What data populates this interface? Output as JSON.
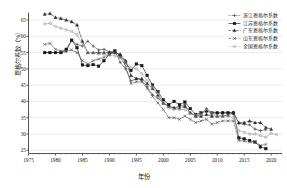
{
  "chart_data": {
    "type": "line",
    "title": "",
    "xlabel": "年份",
    "ylabel": "恩格尔系数（%）",
    "xlim": [
      1975,
      2022
    ],
    "ylim": [
      24,
      67
    ],
    "xticks": [
      1975,
      1980,
      1985,
      1990,
      1995,
      2000,
      2005,
      2010,
      2015,
      2020
    ],
    "yticks": [
      25,
      30,
      35,
      40,
      45,
      50,
      55,
      60,
      65
    ],
    "grid": true,
    "grid_axis": "y",
    "legend_position": "top-right",
    "series": [
      {
        "name": "浙江恩格尔系数",
        "marker": "plus",
        "color": "#3a3a3a",
        "linestyle": "dotted",
        "x": [
          1978,
          1979,
          1980,
          1981,
          1982,
          1983,
          1984,
          1985,
          1986,
          1987,
          1988,
          1989,
          1990,
          1991,
          1992,
          1993,
          1994,
          1995,
          1996,
          1997,
          1998,
          1999,
          2000,
          2001,
          2002,
          2003,
          2004,
          2005,
          2006,
          2007,
          2008,
          2009,
          2010,
          2011,
          2012,
          2013,
          2014,
          2015,
          2016,
          2017,
          2018,
          2019
        ],
        "y": [
          55.0,
          55.0,
          55.0,
          55.0,
          55.3,
          58.8,
          57.5,
          57.0,
          58.5,
          57.0,
          55.8,
          56.0,
          55.2,
          55.5,
          52.0,
          50.0,
          46.3,
          47.0,
          46.5,
          44.5,
          42.0,
          41.0,
          39.5,
          38.5,
          38.0,
          38.5,
          39.0,
          36.5,
          35.5,
          36.0,
          37.8,
          36.5,
          36.4,
          36.5,
          36.5,
          36.5,
          33.2,
          33.0,
          32.8,
          31.5,
          31.0,
          31.3
        ]
      },
      {
        "name": "江苏恩格尔系数",
        "marker": "square",
        "color": "#141414",
        "linestyle": "solid",
        "x": [
          1978,
          1979,
          1980,
          1981,
          1982,
          1983,
          1984,
          1985,
          1986,
          1987,
          1988,
          1989,
          1990,
          1991,
          1992,
          1993,
          1994,
          1995,
          1996,
          1997,
          1998,
          1999,
          2000,
          2001,
          2002,
          2003,
          2004,
          2005,
          2006,
          2007,
          2008,
          2009,
          2010,
          2011,
          2012,
          2013,
          2014,
          2015,
          2016,
          2017,
          2018,
          2019
        ],
        "y": [
          55.0,
          55.0,
          55.0,
          55.0,
          56.0,
          58.8,
          56.5,
          51.2,
          51.0,
          51.3,
          50.8,
          52.5,
          54.5,
          55.5,
          54.0,
          52.0,
          49.5,
          51.5,
          51.0,
          48.0,
          45.0,
          43.0,
          40.5,
          39.0,
          40.0,
          39.0,
          39.8,
          37.8,
          36.0,
          36.5,
          37.0,
          36.5,
          36.5,
          36.5,
          36.5,
          36.5,
          28.8,
          28.5,
          28.0,
          27.5,
          26.0,
          25.5
        ]
      },
      {
        "name": "广东恩格尔系数",
        "marker": "triangle",
        "color": "#2b2b2b",
        "linestyle": "dashed",
        "x": [
          1978,
          1979,
          1980,
          1981,
          1982,
          1983,
          1984,
          1985,
          1986,
          1987,
          1988,
          1989,
          1990,
          1991,
          1992,
          1993,
          1994,
          1995,
          1996,
          1997,
          1998,
          1999,
          2000,
          2001,
          2002,
          2003,
          2004,
          2005,
          2006,
          2007,
          2008,
          2009,
          2010,
          2011,
          2012,
          2013,
          2014,
          2015,
          2016,
          2017,
          2018,
          2019,
          2020
        ],
        "y": [
          66.8,
          67.0,
          65.8,
          65.5,
          65.0,
          64.5,
          63.5,
          58.5,
          55.0,
          55.0,
          55.0,
          55.0,
          55.0,
          55.0,
          54.5,
          52.5,
          48.0,
          47.0,
          47.0,
          45.5,
          44.0,
          42.0,
          39.5,
          38.5,
          38.0,
          38.0,
          38.5,
          36.5,
          35.5,
          35.5,
          36.0,
          35.5,
          35.5,
          35.5,
          35.8,
          36.5,
          33.5,
          33.5,
          34.0,
          33.5,
          33.5,
          32.0,
          31.5
        ]
      },
      {
        "name": "山东恩格尔系数",
        "marker": "cross",
        "color": "#4a4a4a",
        "linestyle": "dashdot",
        "x": [
          1978,
          1979,
          1980,
          1981,
          1982,
          1983,
          1984,
          1985,
          1986,
          1987,
          1988,
          1989,
          1990,
          1991,
          1992,
          1993,
          1994,
          1995,
          1996,
          1997,
          1998,
          1999,
          2000,
          2001,
          2002,
          2003,
          2004,
          2005,
          2006,
          2007,
          2008,
          2009,
          2010,
          2011,
          2012,
          2013,
          2014,
          2015,
          2016,
          2017,
          2018,
          2019
        ],
        "y": [
          57.5,
          57.8,
          56.0,
          55.5,
          55.5,
          55.8,
          55.0,
          52.5,
          51.5,
          52.5,
          53.0,
          53.5,
          54.5,
          55.0,
          53.5,
          51.0,
          45.5,
          46.0,
          46.0,
          44.0,
          41.5,
          39.5,
          37.5,
          35.0,
          35.0,
          34.5,
          35.5,
          34.5,
          33.5,
          34.0,
          34.5,
          33.0,
          33.5,
          34.0,
          34.0,
          34.0,
          28.0,
          27.8,
          27.5,
          27.5,
          26.5,
          26.8
        ]
      },
      {
        "name": "全国恩格尔系数",
        "marker": "circle-open",
        "color": "#9a9a9a",
        "linestyle": "dotted",
        "x": [
          1978,
          1979,
          1980,
          1981,
          1982,
          1983,
          1984,
          1985,
          1986,
          1987,
          1988,
          1989,
          1990,
          1991,
          1992,
          1993,
          1994,
          1995,
          1996,
          1997,
          1998,
          1999,
          2000,
          2001,
          2002,
          2003,
          2004,
          2005,
          2006,
          2007,
          2008,
          2009,
          2010,
          2011,
          2012,
          2013,
          2014,
          2015,
          2016,
          2017,
          2018,
          2019,
          2020,
          2021
        ],
        "y": [
          63.8,
          64.0,
          63.0,
          62.5,
          62.0,
          61.5,
          60.5,
          57.5,
          55.0,
          55.0,
          54.5,
          54.5,
          54.2,
          54.0,
          53.5,
          52.0,
          50.5,
          50.0,
          48.5,
          46.5,
          44.5,
          42.5,
          39.5,
          38.0,
          37.5,
          37.5,
          37.5,
          36.5,
          35.8,
          36.0,
          37.5,
          36.5,
          35.5,
          35.5,
          35.5,
          35.0,
          31.0,
          30.5,
          30.0,
          30.0,
          29.5,
          29.0,
          30.2,
          29.8
        ]
      }
    ]
  }
}
